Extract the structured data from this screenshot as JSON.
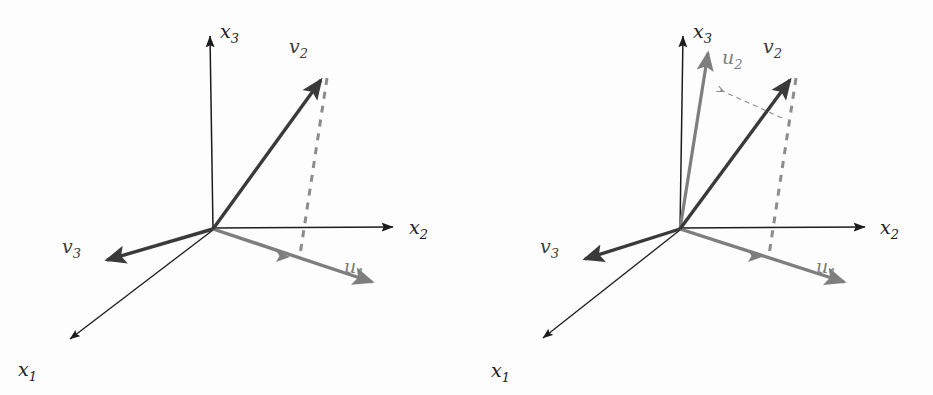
{
  "figure": {
    "colors": {
      "background": "#fdfdfd",
      "axis": "#1c1c1c",
      "vector_dark": "#3a3a3a",
      "vector_gray": "#7e7e7e",
      "dashed_gray": "#8c8c8c"
    },
    "panels": [
      {
        "id": "panel-left",
        "name": "left-panel",
        "origin": {
          "x": 213,
          "y": 229
        },
        "axes": [
          {
            "name": "x1",
            "label": "x",
            "sub": "1",
            "tip": {
              "x": 65,
              "y": 343
            },
            "label_pos": {
              "x": 18,
              "y": 376
            }
          },
          {
            "name": "x2",
            "label": "x",
            "sub": "2",
            "tip": {
              "x": 398,
              "y": 227
            },
            "label_pos": {
              "x": 409,
              "y": 234
            }
          },
          {
            "name": "x3",
            "label": "x",
            "sub": "3",
            "tip": {
              "x": 210,
              "y": 33
            },
            "label_pos": {
              "x": 220,
              "y": 38
            }
          }
        ],
        "vectors": [
          {
            "name": "v2",
            "label": "v",
            "sub": "2",
            "style": "dark",
            "tip": {
              "x": 327,
              "y": 74
            },
            "label_pos": {
              "x": 289,
              "y": 53
            }
          },
          {
            "name": "v3",
            "label": "v",
            "sub": "3",
            "style": "dark",
            "tip": {
              "x": 100,
              "y": 264
            },
            "label_pos": {
              "x": 62,
              "y": 253
            }
          },
          {
            "name": "u1",
            "label": "u",
            "sub": "1",
            "style": "gray",
            "tip": {
              "x": 379,
              "y": 286
            },
            "mid_tip": {
              "x": 288,
              "y": 257
            },
            "label_pos": {
              "x": 344,
              "y": 273
            }
          }
        ],
        "dashed": [
          {
            "name": "v2-projection-drop",
            "from": {
              "x": 327,
              "y": 78
            },
            "to": {
              "x": 300,
              "y": 255
            }
          }
        ]
      },
      {
        "id": "panel-right",
        "name": "right-panel",
        "origin": {
          "x": 214,
          "y": 229
        },
        "axes": [
          {
            "name": "x1",
            "label": "x",
            "sub": "1",
            "tip": {
              "x": 72,
              "y": 342
            },
            "label_pos": {
              "x": 25,
              "y": 377
            }
          },
          {
            "name": "x2",
            "label": "x",
            "sub": "2",
            "tip": {
              "x": 404,
              "y": 227
            },
            "label_pos": {
              "x": 414,
              "y": 234
            }
          },
          {
            "name": "x3",
            "label": "x",
            "sub": "3",
            "tip": {
              "x": 217,
              "y": 33
            },
            "label_pos": {
              "x": 227,
              "y": 38
            }
          }
        ],
        "vectors": [
          {
            "name": "v2",
            "label": "v",
            "sub": "2",
            "style": "dark",
            "tip": {
              "x": 330,
              "y": 74
            },
            "label_pos": {
              "x": 297,
              "y": 53
            }
          },
          {
            "name": "v3",
            "label": "v",
            "sub": "3",
            "style": "dark",
            "tip": {
              "x": 112,
              "y": 263
            },
            "label_pos": {
              "x": 74,
              "y": 253
            }
          },
          {
            "name": "u1",
            "label": "u",
            "sub": "1",
            "style": "gray",
            "tip": {
              "x": 385,
              "y": 286
            },
            "mid_tip": {
              "x": 294,
              "y": 257
            },
            "label_pos": {
              "x": 350,
              "y": 273
            }
          },
          {
            "name": "u2",
            "label": "u",
            "sub": "2",
            "style": "gray",
            "tip": {
              "x": 244,
              "y": 47
            },
            "label_pos": {
              "x": 256,
              "y": 64
            }
          }
        ],
        "dashed": [
          {
            "name": "v2-projection-drop",
            "from": {
              "x": 330,
              "y": 78
            },
            "to": {
              "x": 303,
              "y": 255
            }
          },
          {
            "name": "v2-to-u2-arrow",
            "from": {
              "x": 314,
              "y": 117
            },
            "to": {
              "x": 249,
              "y": 88
            }
          }
        ]
      }
    ]
  }
}
